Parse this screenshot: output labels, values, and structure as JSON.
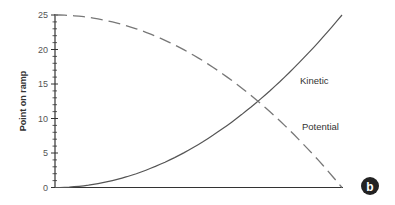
{
  "chart_data": {
    "type": "line",
    "title": "",
    "xlabel": "",
    "ylabel": "Point on ramp",
    "ylim": [
      0,
      25
    ],
    "yticks": [
      "0",
      "5",
      "10",
      "15",
      "20",
      "25"
    ],
    "grid": false,
    "x": [
      0,
      0.1,
      0.2,
      0.3,
      0.4,
      0.5,
      0.6,
      0.7,
      0.8,
      0.9,
      1.0
    ],
    "series": [
      {
        "name": "Kinetic",
        "style": "solid",
        "values": [
          0,
          0.25,
          1,
          2.25,
          4,
          6.25,
          9,
          12.25,
          16,
          20.25,
          25
        ]
      },
      {
        "name": "Potential",
        "style": "dashed",
        "values": [
          25,
          24.75,
          24,
          22.75,
          21,
          18.75,
          16,
          12.75,
          9,
          4.75,
          0
        ]
      }
    ],
    "annotations": [
      "Kinetic",
      "Potential"
    ],
    "panel_label": "b"
  }
}
